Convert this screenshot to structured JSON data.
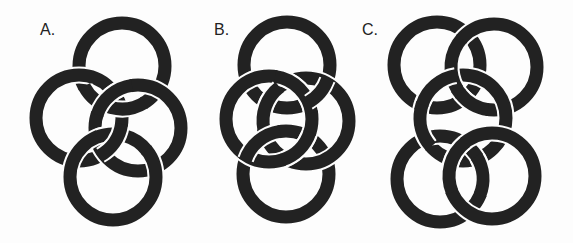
{
  "figure": {
    "ink_color": "#222222",
    "background_color": "#fdfdfd",
    "ring_stroke_width": 13,
    "ring_radius": 43,
    "panels": [
      {
        "label": "A.",
        "label_pos": [
          40,
          22
        ],
        "rings": [
          {
            "name": "top",
            "cx": 122,
            "cy": 66
          },
          {
            "name": "left",
            "cx": 79,
            "cy": 118
          },
          {
            "name": "right",
            "cx": 138,
            "cy": 128
          },
          {
            "name": "bottom",
            "cx": 113,
            "cy": 177
          }
        ]
      },
      {
        "label": "B.",
        "label_pos": [
          214,
          22
        ],
        "rings": [
          {
            "name": "top",
            "cx": 287,
            "cy": 65
          },
          {
            "name": "bottom",
            "cx": 286,
            "cy": 174
          },
          {
            "name": "right",
            "cx": 306,
            "cy": 121
          },
          {
            "name": "left",
            "cx": 269,
            "cy": 119
          }
        ]
      },
      {
        "label": "C.",
        "label_pos": [
          362,
          22
        ],
        "rings": [
          {
            "name": "top-left",
            "cx": 437,
            "cy": 65
          },
          {
            "name": "top-right",
            "cx": 494,
            "cy": 67
          },
          {
            "name": "middle",
            "cx": 463,
            "cy": 118
          },
          {
            "name": "bottom-left",
            "cx": 440,
            "cy": 179
          },
          {
            "name": "bottom-right",
            "cx": 492,
            "cy": 176
          }
        ]
      }
    ]
  }
}
